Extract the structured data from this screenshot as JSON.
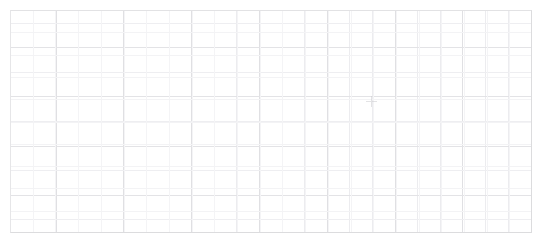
{
  "canvas": {
    "background_color": "#ffffff",
    "width": 544,
    "height": 239
  },
  "sheet": {
    "name": "blank-worksheet-grid",
    "background_color": "#ffffff",
    "border_color": "#dcdcde",
    "gridline_color": "#ececef",
    "gridline_minor_color": "#f4f4f6",
    "bounds": {
      "left": 10,
      "top": 10,
      "width": 522,
      "height": 223
    },
    "column_count": 23,
    "row_count": 10,
    "cell_width": 22.7,
    "cell_height": 22.3,
    "columns": [
      {
        "index": 1,
        "label": "",
        "major": false
      },
      {
        "index": 2,
        "label": "",
        "major": true
      },
      {
        "index": 3,
        "label": "",
        "major": false
      },
      {
        "index": 4,
        "label": "",
        "major": false
      },
      {
        "index": 5,
        "label": "",
        "major": true
      },
      {
        "index": 6,
        "label": "",
        "major": false
      },
      {
        "index": 7,
        "label": "",
        "major": false
      },
      {
        "index": 8,
        "label": "",
        "major": true
      },
      {
        "index": 9,
        "label": "",
        "major": false
      },
      {
        "index": 10,
        "label": "",
        "major": false
      },
      {
        "index": 11,
        "label": "",
        "major": true
      },
      {
        "index": 12,
        "label": "",
        "major": false
      },
      {
        "index": 13,
        "label": "",
        "major": false
      },
      {
        "index": 14,
        "label": "",
        "major": true
      },
      {
        "index": 15,
        "label": "",
        "major": false
      },
      {
        "index": 16,
        "label": "",
        "major": false
      },
      {
        "index": 17,
        "label": "",
        "major": true
      },
      {
        "index": 18,
        "label": "",
        "major": false
      },
      {
        "index": 19,
        "label": "",
        "major": false
      },
      {
        "index": 20,
        "label": "",
        "major": true
      },
      {
        "index": 21,
        "label": "",
        "major": false
      },
      {
        "index": 22,
        "label": "",
        "major": false
      },
      {
        "index": 23,
        "label": "",
        "major": false
      }
    ],
    "rows": [
      {
        "index": 1,
        "major": false,
        "cells": [
          "",
          "",
          "",
          "",
          "",
          "",
          "",
          "",
          "",
          "",
          "",
          "",
          "",
          "",
          "",
          "",
          "",
          "",
          "",
          "",
          "",
          "",
          ""
        ]
      },
      {
        "index": 2,
        "major": true,
        "cells": [
          "",
          "",
          "",
          "",
          "",
          "",
          "",
          "",
          "",
          "",
          "",
          "",
          "",
          "",
          "",
          "",
          "",
          "",
          "",
          "",
          "",
          "",
          ""
        ]
      },
      {
        "index": 3,
        "major": false,
        "cells": [
          "",
          "",
          "",
          "",
          "",
          "",
          "",
          "",
          "",
          "",
          "",
          "",
          "",
          "",
          "",
          "",
          "",
          "",
          "",
          "",
          "",
          "",
          ""
        ]
      },
      {
        "index": 4,
        "major": true,
        "cells": [
          "",
          "",
          "",
          "",
          "",
          "",
          "",
          "",
          "",
          "",
          "",
          "",
          "",
          "",
          "",
          "",
          "",
          "",
          "",
          "",
          "",
          "",
          ""
        ]
      },
      {
        "index": 5,
        "major": false,
        "cells": [
          "",
          "",
          "",
          "",
          "",
          "",
          "",
          "",
          "",
          "",
          "",
          "",
          "",
          "",
          "",
          "",
          "",
          "",
          "",
          "",
          "",
          "",
          ""
        ]
      },
      {
        "index": 6,
        "major": true,
        "cells": [
          "",
          "",
          "",
          "",
          "",
          "",
          "",
          "",
          "",
          "",
          "",
          "",
          "",
          "",
          "",
          "",
          "",
          "",
          "",
          "",
          "",
          "",
          ""
        ]
      },
      {
        "index": 7,
        "major": false,
        "cells": [
          "",
          "",
          "",
          "",
          "",
          "",
          "",
          "",
          "",
          "",
          "",
          "",
          "",
          "",
          "",
          "",
          "",
          "",
          "",
          "",
          "",
          "",
          ""
        ]
      },
      {
        "index": 8,
        "major": true,
        "cells": [
          "",
          "",
          "",
          "",
          "",
          "",
          "",
          "",
          "",
          "",
          "",
          "",
          "",
          "",
          "",
          "",
          "",
          "",
          "",
          "",
          "",
          "",
          ""
        ]
      },
      {
        "index": 9,
        "major": false,
        "cells": [
          "",
          "",
          "",
          "",
          "",
          "",
          "",
          "",
          "",
          "",
          "",
          "",
          "",
          "",
          "",
          "",
          "",
          "",
          "",
          "",
          "",
          "",
          ""
        ]
      },
      {
        "index": 10,
        "major": false,
        "cells": [
          "",
          "",
          "",
          "",
          "",
          "",
          "",
          "",
          "",
          "",
          "",
          "",
          "",
          "",
          "",
          "",
          "",
          "",
          "",
          "",
          "",
          "",
          ""
        ]
      }
    ]
  },
  "cursor": {
    "name": "crosshair-cursor",
    "glyph": "crosshair-icon",
    "color": "#c9c9cd",
    "x": 366,
    "y": 96
  }
}
